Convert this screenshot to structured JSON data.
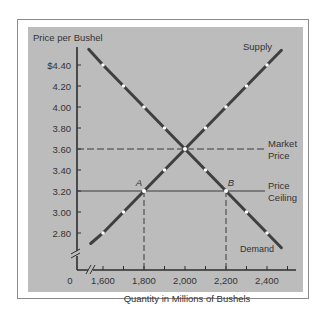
{
  "chart_data": {
    "type": "line",
    "title": "",
    "ylabel": "Price per Bushel",
    "xlabel": "Quantity in Millions of Bushels",
    "x_origin_label": "0",
    "x_ticks": [
      1600,
      1700,
      1800,
      1900,
      2000,
      2100,
      2200,
      2300,
      2400,
      2500
    ],
    "x_tick_labels": [
      "1,600",
      "1,800",
      "2,000",
      "2,200",
      "2,400"
    ],
    "x_tick_label_values": [
      1600,
      1800,
      2000,
      2200,
      2400
    ],
    "y_ticks": [
      2.8,
      3.0,
      3.2,
      3.4,
      3.6,
      3.8,
      4.0,
      4.2,
      4.4
    ],
    "y_tick_labels": [
      "2.80",
      "3.00",
      "3.20",
      "3.40",
      "3.60",
      "3.80",
      "4.00",
      "4.20",
      "$4.40"
    ],
    "xlim": [
      1530,
      2550
    ],
    "ylim": [
      2.6,
      4.6
    ],
    "axis_breaks": true,
    "grid": false,
    "series": [
      {
        "name": "Supply",
        "points": [
          [
            1540,
            2.7
          ],
          [
            1600,
            2.8
          ],
          [
            1700,
            3.0
          ],
          [
            1800,
            3.2
          ],
          [
            1900,
            3.4
          ],
          [
            2000,
            3.6
          ],
          [
            2100,
            3.8
          ],
          [
            2200,
            4.0
          ],
          [
            2300,
            4.2
          ],
          [
            2400,
            4.4
          ],
          [
            2470,
            4.54
          ]
        ],
        "markers": [
          [
            1600,
            2.8
          ],
          [
            1700,
            3.0
          ],
          [
            1900,
            3.4
          ],
          [
            2100,
            3.8
          ],
          [
            2200,
            4.0
          ],
          [
            2300,
            4.2
          ],
          [
            2400,
            4.4
          ]
        ]
      },
      {
        "name": "Demand",
        "points": [
          [
            1530,
            4.55
          ],
          [
            1600,
            4.4
          ],
          [
            1700,
            4.2
          ],
          [
            1800,
            4.0
          ],
          [
            1900,
            3.8
          ],
          [
            2000,
            3.6
          ],
          [
            2100,
            3.4
          ],
          [
            2200,
            3.2
          ],
          [
            2300,
            3.0
          ],
          [
            2400,
            2.8
          ],
          [
            2470,
            2.66
          ]
        ],
        "markers": [
          [
            1600,
            4.4
          ],
          [
            1700,
            4.2
          ],
          [
            1800,
            4.0
          ],
          [
            1900,
            3.8
          ],
          [
            2100,
            3.4
          ],
          [
            2300,
            3.0
          ],
          [
            2400,
            2.8
          ]
        ]
      }
    ],
    "reference_lines": [
      {
        "name": "Market Price",
        "label_lines": [
          "Market",
          "Price"
        ],
        "y": 3.6,
        "style": "dashed"
      },
      {
        "name": "Price Ceiling",
        "label_lines": [
          "Price",
          "Ceiling"
        ],
        "y": 3.2,
        "style": "solid"
      }
    ],
    "annotations": [
      {
        "label": "A",
        "x": 1800,
        "y": 3.2,
        "note": "Quantity supplied at ceiling"
      },
      {
        "label": "B",
        "x": 2200,
        "y": 3.2,
        "note": "Quantity demanded at ceiling"
      }
    ],
    "equilibrium": {
      "x": 2000,
      "y": 3.6
    },
    "series_labels": {
      "supply": "Supply",
      "demand": "Demand"
    }
  },
  "colors": {
    "panel": "#bcbcbc",
    "line": "#3f3f3f",
    "marker": "#ffffff",
    "text": "#333333"
  }
}
